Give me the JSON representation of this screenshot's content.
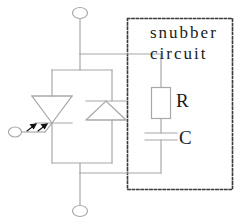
{
  "diagram": {
    "type": "schematic",
    "background_color": "#ffffff",
    "wire_color": "#a8a8a8",
    "text_color": "#1a1a1a",
    "dash_color": "#3a3a3a"
  },
  "labels": {
    "snubber": "snubber",
    "circuit": "circuit",
    "resistor": "R",
    "capacitor": "C"
  },
  "components": [
    {
      "name": "photo-thyristor",
      "symbol": "down-triangle-with-cathode-bar",
      "gate": "optical",
      "arrows": 2,
      "cx": 52,
      "cy": 110
    },
    {
      "name": "diode",
      "symbol": "up-triangle-with-bar",
      "cx": 105,
      "cy": 111
    },
    {
      "name": "resistor",
      "symbol": "rectangle",
      "label": "R",
      "x": 151,
      "y": 87,
      "w": 19,
      "h": 31
    },
    {
      "name": "capacitor",
      "symbol": "parallel-plates",
      "label": "C",
      "cx": 161,
      "y_top": 133,
      "y_bottom": 140,
      "plate_half_width": 16
    }
  ],
  "terminals": [
    {
      "name": "anode-terminal",
      "position": "top",
      "cx": 80,
      "cy": 13
    },
    {
      "name": "cathode-terminal",
      "position": "bottom",
      "cx": 80,
      "cy": 211
    },
    {
      "name": "gate-terminal",
      "position": "left",
      "cx": 15,
      "cy": 132
    }
  ],
  "snubber_box": {
    "x": 127,
    "y": 18,
    "w": 106,
    "h": 172,
    "style": "dashed"
  },
  "nets": {
    "top_rail_y": 54,
    "bottom_rail_y": 173,
    "main_vertical_x": 80,
    "snubber_vertical_x": 161,
    "inner_loop": {
      "x1": 52,
      "x2": 112,
      "y1": 70,
      "y2": 163
    }
  }
}
